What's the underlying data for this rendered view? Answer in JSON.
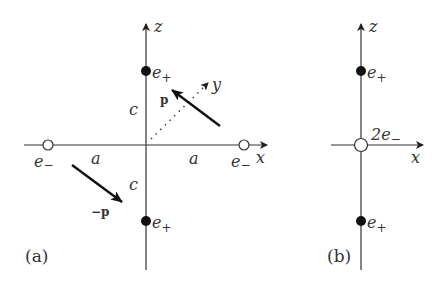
{
  "panels": {
    "a": {
      "caption": "(a)",
      "axes": {
        "z": "z",
        "x": "x",
        "y": "y"
      },
      "charges": {
        "top_plus": {
          "label": "e",
          "sub": "+"
        },
        "bottom_plus": {
          "label": "e",
          "sub": "+"
        },
        "left_minus": {
          "label": "e",
          "sub": "−"
        },
        "right_minus": {
          "label": "e",
          "sub": "−"
        }
      },
      "distances": {
        "upper_c": "c",
        "lower_c": "c",
        "left_a": "a",
        "right_a": "a"
      },
      "vectors": {
        "p": "p",
        "neg_p": "−p"
      }
    },
    "b": {
      "caption": "(b)",
      "axes": {
        "z": "z",
        "x": "x"
      },
      "charges": {
        "top_plus": {
          "label": "e",
          "sub": "+"
        },
        "bottom_plus": {
          "label": "e",
          "sub": "+"
        },
        "center_minus": {
          "label": "2e",
          "sub": "−"
        }
      }
    }
  },
  "colors": {
    "line": "#333333",
    "fill_positive": "#111111",
    "fill_negative": "#ffffff"
  }
}
